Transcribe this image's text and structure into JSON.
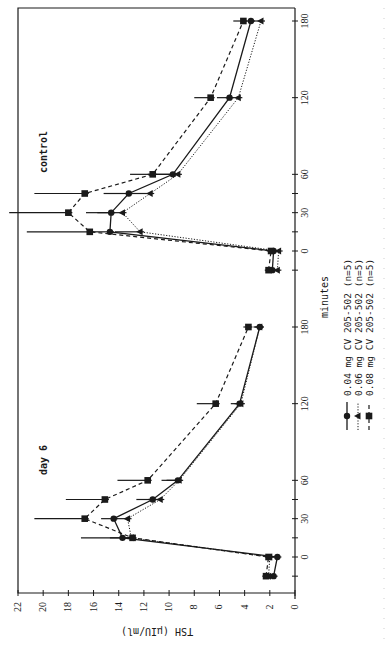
{
  "chart_data": {
    "type": "line",
    "orientation_note_visible": "figure printed rotated 90 degrees counter-clockwise",
    "xlabel": "minutes",
    "ylabel": "TSH (µIU/ml)",
    "ylim": [
      0,
      22
    ],
    "yticks": [
      0,
      2,
      4,
      6,
      8,
      10,
      12,
      14,
      16,
      18,
      20,
      22
    ],
    "xticks_labeled": [
      0,
      30,
      60,
      120,
      180
    ],
    "xticks_minor": [
      -15,
      15,
      45
    ],
    "grid": false,
    "legend_position": "below x-axis label",
    "series_styles": [
      {
        "name": "0.04 mg CV 205-502 (n=5)",
        "marker": "circle",
        "line": "solid"
      },
      {
        "name": "0.06 mg CV 205-502 (n=5)",
        "marker": "triangle",
        "line": "dotted"
      },
      {
        "name": "0.08 mg CV 205-502 (n=5)",
        "marker": "square",
        "line": "dashed"
      }
    ],
    "panels": [
      {
        "title": "control",
        "x": [
          -15,
          0,
          15,
          30,
          45,
          60,
          120,
          180
        ],
        "series": [
          {
            "name": "0.04 mg CV 205-502 (n=5)",
            "values": [
              1.8,
              1.7,
              14.7,
              14.6,
              13.2,
              9.7,
              5.2,
              3.5
            ],
            "err": [
              0.3,
              0.3,
              1.8,
              2.0,
              2.0,
              2.0,
              1.0,
              0.7
            ]
          },
          {
            "name": "0.06 mg CV 205-502 (n=5)",
            "values": [
              1.4,
              1.3,
              12.3,
              13.7,
              11.5,
              9.3,
              4.5,
              2.7
            ],
            "err": [
              0.3,
              0.3,
              2.0,
              2.0,
              1.8,
              2.0,
              1.0,
              0.6
            ]
          },
          {
            "name": "0.08 mg CV 205-502 (n=5)",
            "values": [
              2.1,
              1.9,
              16.3,
              18.0,
              16.7,
              11.3,
              6.7,
              4.1
            ],
            "err": [
              0.3,
              0.3,
              5.0,
              4.7,
              4.0,
              1.8,
              1.3,
              0.8
            ]
          }
        ]
      },
      {
        "title": "day 6",
        "x": [
          -15,
          0,
          15,
          30,
          45,
          60,
          120,
          180
        ],
        "series": [
          {
            "name": "0.04 mg CV 205-502 (n=5)",
            "values": [
              1.7,
              1.4,
              13.7,
              14.4,
              11.3,
              9.3,
              4.4,
              2.8
            ],
            "err": [
              0.4,
              0.4,
              1.0,
              1.0,
              1.3,
              1.3,
              0.7,
              0.5
            ]
          },
          {
            "name": "0.06 mg CV 205-502 (n=5)",
            "values": [
              2.1,
              2.0,
              13.0,
              13.3,
              10.7,
              9.2,
              4.3,
              2.8
            ],
            "err": [
              0.3,
              0.3,
              4.0,
              1.2,
              1.0,
              1.0,
              0.5,
              0.4
            ]
          },
          {
            "name": "0.08 mg CV 205-502 (n=5)",
            "values": [
              2.3,
              2.1,
              12.9,
              16.7,
              15.1,
              11.7,
              6.3,
              3.7
            ],
            "err": [
              0.3,
              0.3,
              0.5,
              4.0,
              3.1,
              2.4,
              1.5,
              0.4
            ]
          }
        ]
      }
    ]
  },
  "labels": {
    "panel_control": "control",
    "panel_day6": "day 6",
    "x_axis_title": "minutes",
    "y_axis_title": "TSH (µIU/ml)",
    "legend": [
      {
        "text": "0.04 mg CV 205-502  (n=5)",
        "marker": "circle",
        "line": "solid"
      },
      {
        "text": "0.06 mg CV 205-502  (n=5)",
        "marker": "triangle",
        "line": "dotted"
      },
      {
        "text": "0.08 mg CV 205-502  (n=5)",
        "marker": "square",
        "line": "dashed"
      }
    ]
  },
  "colors": {
    "ink": "#1a1a1a",
    "background": "#ffffff",
    "faint_caption": "#cfcfcf"
  }
}
